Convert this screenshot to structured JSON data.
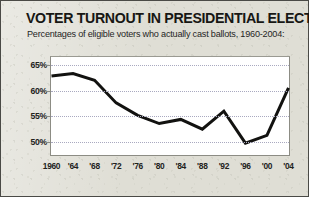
{
  "header": {
    "title": "VOTER TURNOUT IN PRESIDENTIAL ELECTIONS",
    "subtitle": "Percentages of eligible voters who actually cast ballots, 1960-2004:"
  },
  "colors": {
    "page_background": "#dfded5",
    "plot_background": "#ffffff",
    "line": "#121210",
    "gridline": "#a9a9c0",
    "border": "#4a4a46",
    "text": "#171714"
  },
  "chart_data": {
    "type": "line",
    "title": "VOTER TURNOUT IN PRESIDENTIAL ELECTIONS",
    "subtitle": "Percentages of eligible voters who actually cast ballots, 1960-2004:",
    "xlabel": "",
    "ylabel": "",
    "x": [
      1960,
      1964,
      1968,
      1972,
      1976,
      1980,
      1984,
      1988,
      1992,
      1996,
      2000,
      2004
    ],
    "xtick_labels": [
      "1960",
      "'64",
      "'68",
      "'72",
      "'76",
      "'80",
      "'84",
      "'88",
      "'92",
      "'96",
      "'00",
      "'04"
    ],
    "values": [
      62.8,
      63.3,
      62.0,
      57.6,
      55.2,
      53.6,
      54.4,
      52.5,
      56.0,
      49.8,
      51.3,
      60.5
    ],
    "series": [
      {
        "name": "Voter turnout",
        "values": [
          62.8,
          63.3,
          62.0,
          57.6,
          55.2,
          53.6,
          54.4,
          52.5,
          56.0,
          49.8,
          51.3,
          60.5
        ]
      }
    ],
    "ylim": [
      47.5,
      66.5
    ],
    "ytick_values": [
      65,
      60,
      55,
      50
    ],
    "ytick_labels": [
      "65%",
      "60%",
      "55%",
      "50%"
    ],
    "grid": true,
    "grid_axis": "y",
    "grid_style": "dotted",
    "legend": false,
    "legend_position": "none",
    "line_width_px": 3,
    "markers": false,
    "annotations": []
  }
}
